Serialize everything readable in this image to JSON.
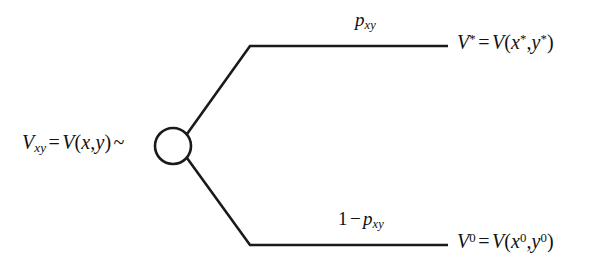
{
  "figure": {
    "type": "binomial-branch-diagram",
    "background_color": "#ffffff",
    "stroke_color": "#1a1a1a",
    "stroke_width": 2.6
  },
  "node": {
    "name": "chance-node",
    "shape": "circle",
    "center_x": 173,
    "center_y": 146,
    "radius": 18,
    "fill": "#ffffff"
  },
  "source": {
    "v": "V",
    "sub": "xy",
    "equals": "=",
    "fn": "V",
    "open": "(",
    "arg1": "x",
    "comma": ",",
    "arg2": "y",
    "close": ")",
    "tilde": "~"
  },
  "branches": {
    "up": {
      "probability": {
        "p": "p",
        "sub": "xy"
      },
      "outcome": {
        "v": "V",
        "sup": "*",
        "equals": "=",
        "fn": "V",
        "open": "(",
        "arg1": "x",
        "arg1_sup": "*",
        "comma": ",",
        "arg2": "y",
        "arg2_sup": "*",
        "close": ")"
      },
      "path": {
        "diagonal_from_x": 187,
        "diagonal_from_y": 134,
        "elbow_x": 250,
        "elbow_y": 46,
        "end_x": 448,
        "end_y": 46
      }
    },
    "down": {
      "probability": {
        "one": "1",
        "minus": "−",
        "p": "p",
        "sub": "xy"
      },
      "outcome": {
        "v": "V",
        "sup": "0",
        "equals": "=",
        "fn": "V",
        "open": "(",
        "arg1": "x",
        "arg1_sup": "0",
        "comma": ",",
        "arg2": "y",
        "arg2_sup": "0",
        "close": ")"
      },
      "path": {
        "diagonal_from_x": 187,
        "diagonal_from_y": 158,
        "elbow_x": 250,
        "elbow_y": 245,
        "end_x": 448,
        "end_y": 245
      }
    }
  }
}
